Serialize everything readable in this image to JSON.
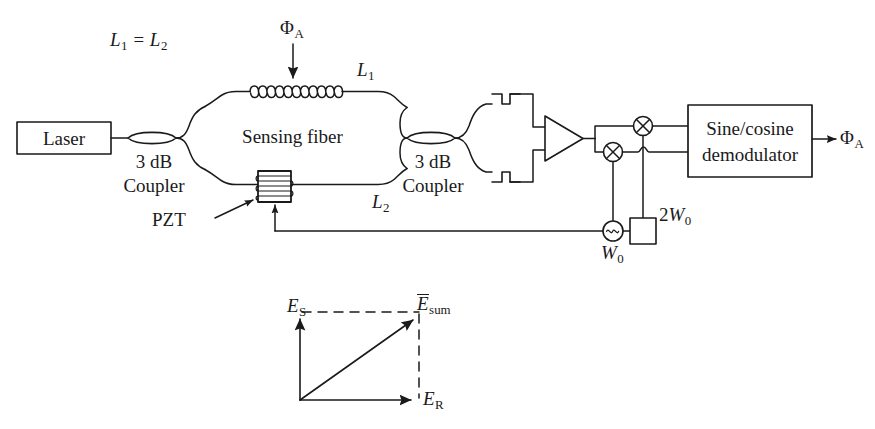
{
  "figure": {
    "type": "optical-fiber-interferometer-block-diagram"
  },
  "labels": {
    "path_equality": {
      "main": "L",
      "sub1": "1",
      "eq": " = ",
      "main2": "L",
      "sub2": "2",
      "text": "L1 = L2"
    },
    "measurand_top": {
      "symbol": "Φ",
      "sub": "A",
      "text": "ΦA"
    },
    "arm_upper": {
      "symbol": "L",
      "sub": "1",
      "text": "L1"
    },
    "arm_lower": {
      "symbol": "L",
      "sub": "2",
      "text": "L2"
    },
    "laser": "Laser",
    "coupler_left_line1": "3 dB",
    "coupler_left_line2": "Coupler",
    "coupler_right_line1": "3 dB",
    "coupler_right_line2": "Coupler",
    "sensing_fiber": "Sensing fiber",
    "pzt": "PZT",
    "demodulator_line1": "Sine/cosine",
    "demodulator_line2": "demodulator",
    "output": {
      "symbol": "Φ",
      "sub": "A",
      "text": "ΦA"
    },
    "oscillator": {
      "symbol": "W",
      "sub": "0",
      "text": "W0"
    },
    "doubler": {
      "prefix": "2",
      "symbol": "W",
      "sub": "0",
      "text": "2W0"
    },
    "vector_Es": {
      "symbol": "E",
      "sub": "S",
      "text": "ES"
    },
    "vector_Esum": {
      "symbol": "E",
      "sub": "sum",
      "text": "Esum",
      "overbar": true
    },
    "vector_Er": {
      "symbol": "E",
      "sub": "R",
      "text": "ER"
    }
  },
  "components": [
    {
      "name": "laser-source",
      "label": "Laser",
      "shape": "rectangle"
    },
    {
      "name": "coupler-left",
      "label": "3 dB Coupler",
      "shape": "fiber-coupler-lens"
    },
    {
      "name": "sensing-fiber-coil",
      "label": "Sensing fiber",
      "shape": "helix-coil",
      "loops": 11
    },
    {
      "name": "pzt-modulator",
      "label": "PZT",
      "shape": "wound-cylinder"
    },
    {
      "name": "coupler-right",
      "label": "3 dB Coupler",
      "shape": "fiber-coupler-lens"
    },
    {
      "name": "photodetector-upper",
      "label": "",
      "shape": "detector-bracket"
    },
    {
      "name": "photodetector-lower",
      "label": "",
      "shape": "detector-bracket"
    },
    {
      "name": "differential-amplifier",
      "label": "",
      "shape": "triangle"
    },
    {
      "name": "mixer-upper",
      "label": "",
      "shape": "circle-with-cross"
    },
    {
      "name": "mixer-lower",
      "label": "",
      "shape": "circle-with-cross"
    },
    {
      "name": "local-oscillator",
      "label": "W0",
      "shape": "circle-with-tilde"
    },
    {
      "name": "frequency-doubler",
      "label": "2W0",
      "shape": "square"
    },
    {
      "name": "sine-cosine-demodulator",
      "label": "Sine/cosine demodulator",
      "shape": "rectangle"
    }
  ],
  "vector_diagram": {
    "name": "phasor-diagram",
    "vectors": [
      {
        "name": "signal-field",
        "label": "ES",
        "direction": "up",
        "style": "solid"
      },
      {
        "name": "reference-field",
        "label": "ER",
        "direction": "right",
        "style": "solid"
      },
      {
        "name": "sum-field",
        "label": "Esum",
        "direction": "diagonal-up-right",
        "style": "solid"
      }
    ],
    "construction_lines": "dashed"
  },
  "colors": {
    "stroke": "#1a1a1a",
    "background": "#ffffff"
  }
}
